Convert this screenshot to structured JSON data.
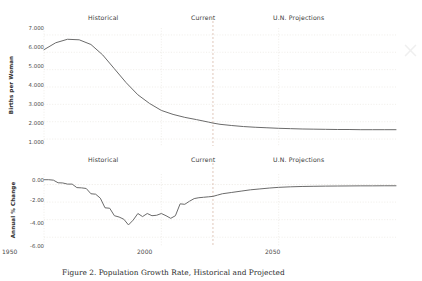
{
  "figure": {
    "caption": "Figure 2. Population Growth Rate, Historical and Projected",
    "corner_mark_icon": "close-x-icon",
    "background_color": "#ffffff",
    "line_color": "#6b6b6b",
    "grid_color": "#e8e4de",
    "divider_color": "#d8b9a8"
  },
  "sections": {
    "historical": "Historical",
    "current": "Current",
    "projections": "U.N. Projections"
  },
  "chart_data": [
    {
      "type": "line",
      "id": "fertility",
      "title": "",
      "xlabel": "",
      "ylabel": "Births per Woman",
      "xlim": [
        1950,
        2100
      ],
      "ylim": [
        0.6,
        7.4
      ],
      "xticks": [
        1950,
        2000,
        2050
      ],
      "xticklabels": [
        "1950",
        "2000",
        "2050"
      ],
      "yticks": [
        1,
        2,
        3,
        4,
        5,
        6,
        7
      ],
      "yticklabels": [
        "1.000",
        "2.000",
        "3.000",
        "4.000",
        "5.000",
        "6.000",
        "7.000"
      ],
      "grid": true,
      "legend": "none",
      "divider_x": 2022,
      "divider_label": "Current",
      "x": [
        1950,
        1955,
        1960,
        1965,
        1970,
        1975,
        1980,
        1985,
        1990,
        1995,
        2000,
        2005,
        2010,
        2015,
        2020,
        2022,
        2025,
        2030,
        2035,
        2040,
        2045,
        2050,
        2055,
        2060,
        2065,
        2070,
        2075,
        2080,
        2085,
        2090,
        2095,
        2100
      ],
      "y": [
        6.15,
        6.55,
        6.75,
        6.72,
        6.45,
        5.85,
        5.05,
        4.25,
        3.55,
        3.05,
        2.65,
        2.42,
        2.25,
        2.12,
        1.98,
        1.92,
        1.85,
        1.78,
        1.72,
        1.68,
        1.65,
        1.62,
        1.6,
        1.58,
        1.57,
        1.56,
        1.55,
        1.55,
        1.54,
        1.54,
        1.54,
        1.54
      ]
    },
    {
      "type": "line",
      "id": "annual-pct-change",
      "title": "",
      "xlabel": "",
      "ylabel": "Annual % Change",
      "xlim": [
        1950,
        2100
      ],
      "ylim": [
        -7.0,
        1.2
      ],
      "xticks": [
        1950,
        2000,
        2050
      ],
      "xticklabels": [
        "1950",
        "2000",
        "2050"
      ],
      "yticks": [
        0,
        -2,
        -4,
        -6
      ],
      "yticklabels": [
        "0.00",
        "-2.00",
        "-4.00",
        "-6.00"
      ],
      "grid": true,
      "legend": "none",
      "divider_x": 2022,
      "divider_label": "Current",
      "x": [
        1950,
        1952,
        1954,
        1956,
        1958,
        1960,
        1962,
        1964,
        1966,
        1968,
        1970,
        1972,
        1974,
        1976,
        1978,
        1980,
        1982,
        1984,
        1986,
        1988,
        1990,
        1992,
        1994,
        1996,
        1998,
        2000,
        2002,
        2004,
        2006,
        2008,
        2010,
        2012,
        2014,
        2016,
        2018,
        2020,
        2022,
        2024,
        2026,
        2030,
        2034,
        2038,
        2042,
        2046,
        2050,
        2055,
        2060,
        2065,
        2070,
        2075,
        2080,
        2085,
        2090,
        2095,
        2100
      ],
      "y": [
        0.55,
        0.55,
        0.5,
        0.2,
        0.18,
        0.05,
        0.05,
        -0.35,
        -0.38,
        -0.45,
        -1.05,
        -1.1,
        -1.55,
        -2.65,
        -2.7,
        -3.55,
        -3.7,
        -3.95,
        -4.6,
        -4.05,
        -3.3,
        -3.65,
        -3.3,
        -3.55,
        -3.5,
        -3.3,
        -3.55,
        -3.85,
        -3.55,
        -2.2,
        -2.25,
        -1.9,
        -1.6,
        -1.5,
        -1.45,
        -1.4,
        -1.35,
        -1.2,
        -1.05,
        -0.9,
        -0.75,
        -0.6,
        -0.5,
        -0.4,
        -0.32,
        -0.26,
        -0.22,
        -0.2,
        -0.18,
        -0.17,
        -0.16,
        -0.15,
        -0.15,
        -0.14,
        -0.14
      ]
    }
  ]
}
